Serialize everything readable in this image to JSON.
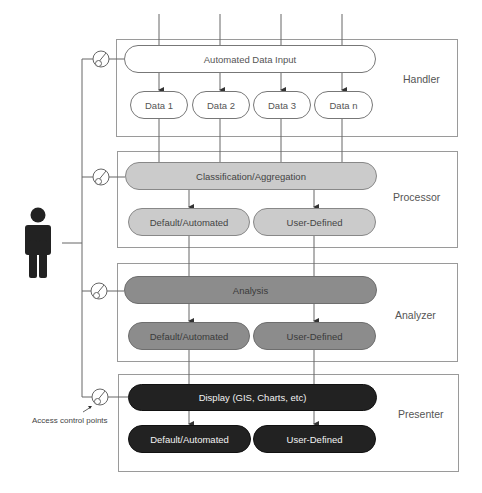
{
  "diagram": {
    "layers": [
      {
        "name": "Handler",
        "main_node": "Automated Data Input",
        "sub_nodes": [
          "Data 1",
          "Data 2",
          "Data 3",
          "Data n"
        ]
      },
      {
        "name": "Processor",
        "main_node": "Classification/Aggregation",
        "sub_nodes": [
          "Default/Automated",
          "User-Defined"
        ]
      },
      {
        "name": "Analyzer",
        "main_node": "Analysis",
        "sub_nodes": [
          "Default/Automated",
          "User-Defined"
        ]
      },
      {
        "name": "Presenter",
        "main_node": "Display (GIS, Charts, etc)",
        "sub_nodes": [
          "Default/Automated",
          "User-Defined"
        ]
      }
    ],
    "actor": {
      "icon": "person-icon"
    },
    "access_control": {
      "label": "Access control points",
      "icon": "access-control-point-icon",
      "count": 4
    },
    "colors": {
      "handler_fill": "#ffffff",
      "processor_fill": "#cbcbcb",
      "analyzer_fill": "#8c8c8c",
      "presenter_fill": "#222222",
      "line": "#666666"
    }
  }
}
